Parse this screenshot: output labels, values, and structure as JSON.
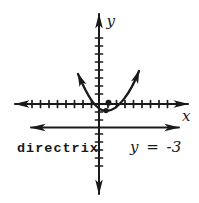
{
  "figure": {
    "labels": {
      "y_axis": "y",
      "x_axis": "x",
      "directrix": "directrix",
      "directrix_equation": "y = -3"
    },
    "colors": {
      "ink": "#1a1a1a",
      "background": "#ffffff"
    }
  }
}
